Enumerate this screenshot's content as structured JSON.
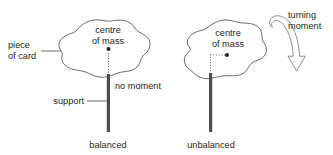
{
  "figure": {
    "width": 333,
    "height": 155,
    "background_color": "#ffffff",
    "ink_color": "#231f20",
    "outline_color": "#58585b",
    "post_color": "#4d4d4f",
    "plumb_color": "#6d6e71",
    "arrow_color": "#808285"
  },
  "left_panel": {
    "name": "balanced-case",
    "labels": {
      "piece_of_card_line1": "piece",
      "piece_of_card_line2": "of card",
      "centre_of_mass_line1": "centre",
      "centre_of_mass_line2": "of mass",
      "no_moment": "no moment",
      "support": "support",
      "caption": "balanced"
    }
  },
  "right_panel": {
    "name": "unbalanced-case",
    "labels": {
      "centre_of_mass_line1": "centre",
      "centre_of_mass_line2": "of mass",
      "turning_moment_line1": "turning",
      "turning_moment_line2": "moment",
      "caption": "unbalanced"
    }
  }
}
